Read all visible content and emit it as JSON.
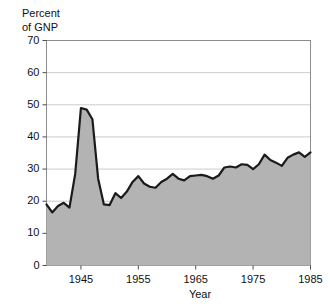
{
  "chart_data": {
    "type": "area",
    "title": "",
    "subtitle": "",
    "xlabel": "Year",
    "ylabel": "Percent of GNP",
    "ylabel_lines": [
      "Percent",
      "of GNP"
    ],
    "xlim": [
      1939,
      1985
    ],
    "ylim": [
      0,
      70
    ],
    "yticks": [
      0,
      10,
      20,
      30,
      40,
      50,
      60,
      70
    ],
    "ytick_labels": [
      "0",
      "10",
      "20",
      "30",
      "40",
      "50",
      "60",
      "70"
    ],
    "xticks": [
      1945,
      1955,
      1965,
      1975,
      1985
    ],
    "xtick_labels": [
      "1945",
      "1955",
      "1965",
      "1975",
      "1985"
    ],
    "grid": "horizontal",
    "legend": "none",
    "fill_color": "#b3b3b3",
    "line_color": "#1a1a1a",
    "frame_color": "#8c8c8c",
    "gridline_color": "#cccccc",
    "background_color": "#ffffff",
    "x": [
      1939,
      1940,
      1941,
      1942,
      1943,
      1944,
      1945,
      1946,
      1947,
      1948,
      1949,
      1950,
      1951,
      1952,
      1953,
      1954,
      1955,
      1956,
      1957,
      1958,
      1959,
      1960,
      1961,
      1962,
      1963,
      1964,
      1965,
      1966,
      1967,
      1968,
      1969,
      1970,
      1971,
      1972,
      1973,
      1974,
      1975,
      1976,
      1977,
      1978,
      1979,
      1980,
      1981,
      1982,
      1983,
      1984,
      1985
    ],
    "values": [
      19.0,
      16.5,
      18.5,
      19.5,
      18.0,
      28.5,
      49.0,
      48.5,
      45.5,
      27.0,
      19.0,
      18.8,
      22.5,
      21.0,
      23.0,
      26.0,
      27.8,
      25.5,
      24.5,
      24.2,
      26.0,
      27.0,
      28.5,
      27.0,
      26.5,
      27.8,
      28.0,
      28.2,
      27.8,
      27.0,
      28.0,
      30.5,
      30.8,
      30.5,
      31.5,
      31.3,
      30.0,
      31.5,
      34.5,
      32.8,
      32.0,
      31.0,
      33.5,
      34.5,
      35.2,
      33.8,
      35.2
    ],
    "series_name": "Percent of GNP"
  }
}
